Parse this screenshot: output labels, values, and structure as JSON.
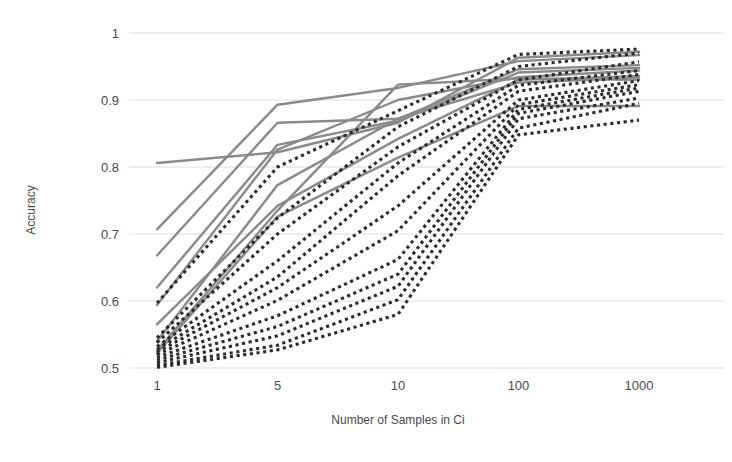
{
  "chart_data": {
    "type": "line",
    "title": "",
    "xlabel": "Number of Samples in Ci",
    "ylabel": "Accuracy",
    "categories": [
      "1",
      "5",
      "10",
      "100",
      "1000"
    ],
    "x_tick_labels": [
      "1",
      "5",
      "10",
      "100",
      "1000"
    ],
    "y_tick_labels": [
      "0.5",
      "0.6",
      "0.7",
      "0.8",
      "0.9",
      "1"
    ],
    "y_tick_values": [
      0.5,
      0.6,
      0.7,
      0.8,
      0.9,
      1.0
    ],
    "ylim": [
      0.5,
      1.0
    ],
    "grid": "horizontal",
    "legend": "none",
    "x_scale": "ordinal",
    "colors": {
      "solid_line": "#8a8a8a",
      "dotted_line": "#2b2b2b",
      "gridline": "#dcdcdc",
      "text": "#4a4a4a",
      "background": "#ffffff"
    },
    "series": [
      {
        "name": "solid-1",
        "style": "solid",
        "values": [
          0.806,
          0.822,
          0.866,
          0.963,
          0.972
        ]
      },
      {
        "name": "solid-2",
        "style": "solid",
        "values": [
          0.707,
          0.893,
          0.918,
          0.958,
          0.967
        ]
      },
      {
        "name": "solid-3",
        "style": "solid",
        "values": [
          0.668,
          0.866,
          0.872,
          0.946,
          0.952
        ]
      },
      {
        "name": "solid-4",
        "style": "solid",
        "values": [
          0.62,
          0.833,
          0.869,
          0.941,
          0.948
        ]
      },
      {
        "name": "solid-5",
        "style": "solid",
        "values": [
          0.594,
          0.826,
          0.9,
          0.934,
          0.944
        ]
      },
      {
        "name": "solid-6",
        "style": "solid",
        "values": [
          0.565,
          0.742,
          0.842,
          0.93,
          0.936
        ]
      },
      {
        "name": "solid-7",
        "style": "solid",
        "values": [
          0.54,
          0.773,
          0.872,
          0.926,
          0.933
        ]
      },
      {
        "name": "solid-8",
        "style": "solid",
        "values": [
          0.526,
          0.735,
          0.923,
          0.932,
          0.93
        ]
      },
      {
        "name": "solid-9",
        "style": "solid",
        "values": [
          0.522,
          0.726,
          0.814,
          0.891,
          0.891
        ]
      },
      {
        "name": "dotted-1",
        "style": "dotted",
        "values": [
          0.597,
          0.8,
          0.884,
          0.968,
          0.976
        ]
      },
      {
        "name": "dotted-2",
        "style": "dotted",
        "values": [
          0.545,
          0.724,
          0.86,
          0.95,
          0.97
        ]
      },
      {
        "name": "dotted-3",
        "style": "dotted",
        "values": [
          0.538,
          0.7,
          0.83,
          0.93,
          0.957
        ]
      },
      {
        "name": "dotted-4",
        "style": "dotted",
        "values": [
          0.532,
          0.66,
          0.806,
          0.922,
          0.944
        ]
      },
      {
        "name": "dotted-5",
        "style": "dotted",
        "values": [
          0.528,
          0.636,
          0.787,
          0.913,
          0.938
        ]
      },
      {
        "name": "dotted-6",
        "style": "dotted",
        "values": [
          0.524,
          0.62,
          0.742,
          0.9,
          0.929
        ]
      },
      {
        "name": "dotted-7",
        "style": "dotted",
        "values": [
          0.52,
          0.601,
          0.705,
          0.893,
          0.923
        ]
      },
      {
        "name": "dotted-8",
        "style": "dotted",
        "values": [
          0.516,
          0.578,
          0.662,
          0.886,
          0.918
        ]
      },
      {
        "name": "dotted-9",
        "style": "dotted",
        "values": [
          0.512,
          0.562,
          0.64,
          0.88,
          0.913
        ]
      },
      {
        "name": "dotted-10",
        "style": "dotted",
        "values": [
          0.508,
          0.548,
          0.622,
          0.872,
          0.903
        ]
      },
      {
        "name": "dotted-11",
        "style": "dotted",
        "values": [
          0.504,
          0.534,
          0.602,
          0.858,
          0.895
        ]
      },
      {
        "name": "dotted-12",
        "style": "dotted",
        "values": [
          0.501,
          0.527,
          0.58,
          0.848,
          0.87
        ]
      }
    ]
  }
}
